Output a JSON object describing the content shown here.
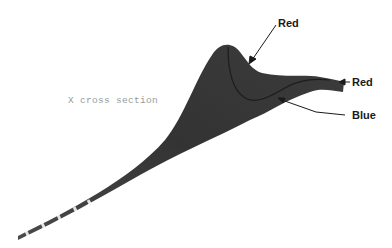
{
  "figure": {
    "section_label": "X cross section",
    "annotations": [
      {
        "label": "Red",
        "target": "peak-upper-ridge"
      },
      {
        "label": "Red",
        "target": "right-edge-tip"
      },
      {
        "label": "Blue",
        "target": "lower-curve"
      }
    ],
    "colors": {
      "surface": "#3a3a3a",
      "surface_dark": "#2a2a2a",
      "text": "#1a1a1a",
      "section_text": "#9a9a9a"
    }
  }
}
